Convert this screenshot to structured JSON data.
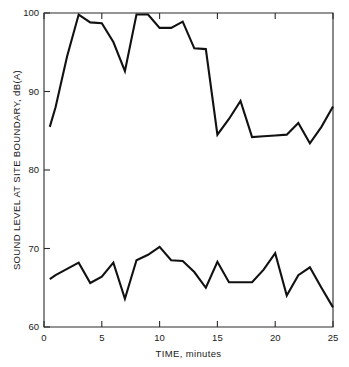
{
  "chart_data": {
    "type": "line",
    "title": "",
    "xlabel": "TIME, minutes",
    "ylabel": "SOUND LEVEL AT SITE BOUNDARY, dB(A)",
    "xlim": [
      0,
      25
    ],
    "ylim": [
      60,
      100
    ],
    "xticks": [
      0,
      5,
      10,
      15,
      20,
      25
    ],
    "xtick_labels": [
      "0",
      "5",
      "10",
      "15",
      "20",
      "25"
    ],
    "yticks": [
      60,
      70,
      80,
      90,
      100
    ],
    "ytick_labels": [
      "60",
      "70",
      "80",
      "90",
      "100"
    ],
    "grid": false,
    "legend": null,
    "line_color": "#111111",
    "frame_color": "#2a2a2a",
    "background": "#ffffff",
    "series": [
      {
        "name": "upper",
        "x": [
          0.5,
          1,
          2,
          3,
          4,
          5,
          6,
          7,
          8,
          9,
          10,
          11,
          12,
          13,
          14,
          15,
          16,
          17,
          18,
          19,
          20,
          21,
          22,
          23,
          24,
          25
        ],
        "values": [
          85.5,
          88.0,
          94.5,
          99.8,
          98.8,
          98.7,
          96.3,
          92.6,
          99.8,
          99.8,
          98.1,
          98.1,
          98.9,
          95.5,
          95.4,
          84.5,
          86.5,
          88.8,
          84.2,
          84.3,
          84.4,
          84.5,
          86.0,
          83.4,
          85.5,
          88.1
        ]
      },
      {
        "name": "lower",
        "x": [
          0.5,
          1,
          2,
          3,
          4,
          5,
          6,
          7,
          8,
          9,
          10,
          11,
          12,
          13,
          14,
          15,
          16,
          17,
          18,
          19,
          20,
          21,
          22,
          23,
          24,
          25
        ],
        "values": [
          66.1,
          66.6,
          67.4,
          68.2,
          65.6,
          66.4,
          68.2,
          63.6,
          68.5,
          69.2,
          70.2,
          68.5,
          68.4,
          67.0,
          65.0,
          68.3,
          65.7,
          65.7,
          65.7,
          67.3,
          69.4,
          64.0,
          66.6,
          67.6,
          65.0,
          62.5
        ]
      }
    ]
  },
  "axes": {
    "x_title": "TIME, minutes",
    "y_title": "SOUND LEVEL AT SITE BOUNDARY, dB(A)"
  }
}
